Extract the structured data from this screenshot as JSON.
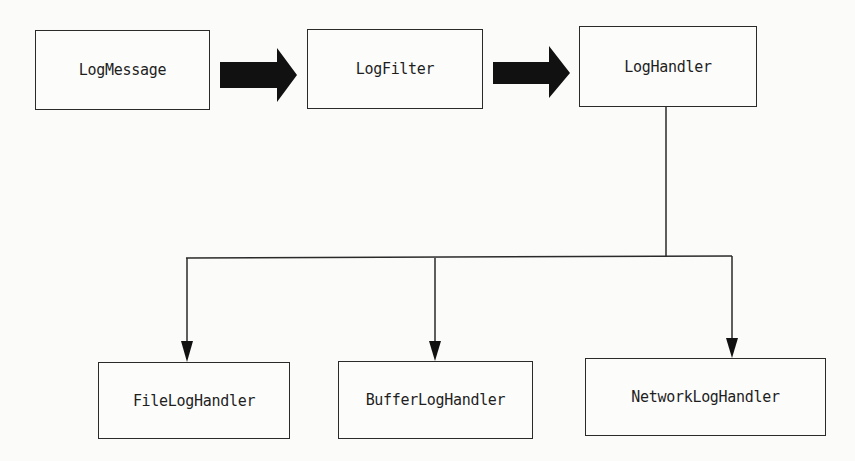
{
  "diagram": {
    "nodes": {
      "log_message": "LogMessage",
      "log_filter": "LogFilter",
      "log_handler": "LogHandler",
      "file_log_handler": "FileLogHandler",
      "buffer_log_handler": "BufferLogHandler",
      "network_log_handler": "NetworkLogHandler"
    },
    "edges": [
      {
        "from": "LogMessage",
        "to": "LogFilter",
        "style": "thick-block-arrow"
      },
      {
        "from": "LogFilter",
        "to": "LogHandler",
        "style": "thick-block-arrow"
      },
      {
        "from": "LogHandler",
        "to": "FileLogHandler",
        "style": "line-arrow"
      },
      {
        "from": "LogHandler",
        "to": "BufferLogHandler",
        "style": "line-arrow"
      },
      {
        "from": "LogHandler",
        "to": "NetworkLogHandler",
        "style": "line-arrow"
      }
    ],
    "colors": {
      "stroke": "#2a2a2a",
      "arrow_fill": "#111111",
      "background": "#fbfbfa"
    }
  }
}
